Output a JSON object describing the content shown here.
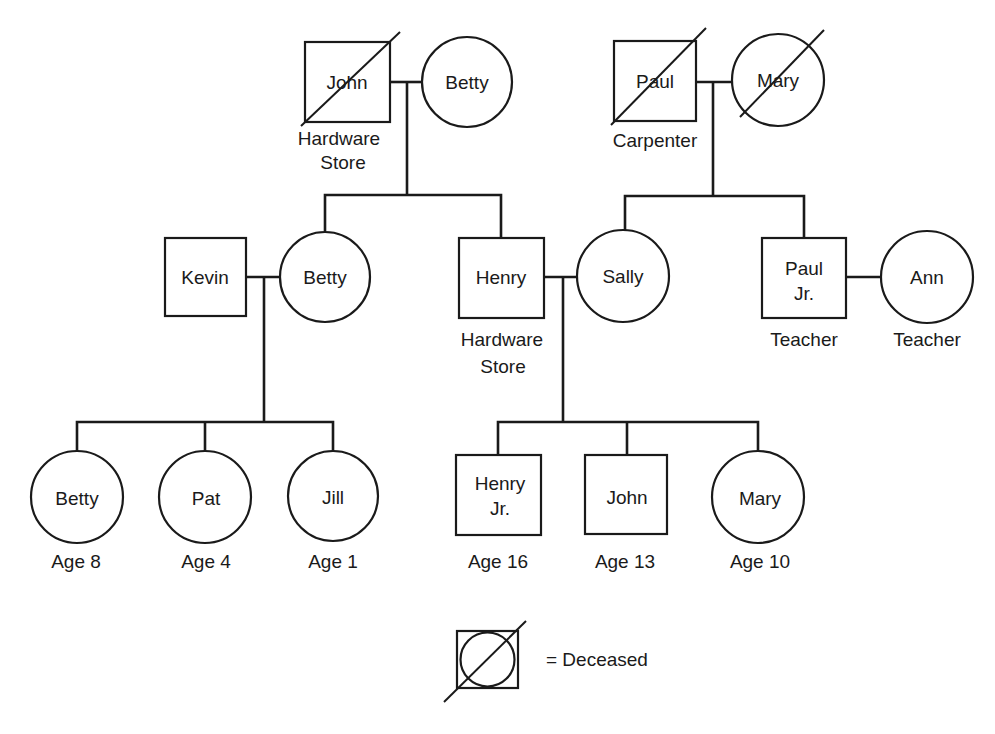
{
  "diagram": {
    "type": "genogram",
    "generation1": {
      "left_couple": {
        "husband": {
          "name": "John",
          "occupation_line1": "Hardware",
          "occupation_line2": "Store",
          "sex": "male",
          "deceased": true
        },
        "wife": {
          "name": "Betty",
          "sex": "female",
          "deceased": false
        }
      },
      "right_couple": {
        "husband": {
          "name": "Paul",
          "occupation": "Carpenter",
          "sex": "male",
          "deceased": true
        },
        "wife": {
          "name": "Mary",
          "sex": "female",
          "deceased": true
        }
      }
    },
    "generation2": {
      "kevin": {
        "name": "Kevin",
        "sex": "male"
      },
      "betty": {
        "name": "Betty",
        "sex": "female"
      },
      "henry": {
        "name": "Henry",
        "occupation_line1": "Hardware",
        "occupation_line2": "Store",
        "sex": "male"
      },
      "sally": {
        "name": "Sally",
        "sex": "female"
      },
      "paul_jr": {
        "name_line1": "Paul",
        "name_line2": "Jr.",
        "occupation": "Teacher",
        "sex": "male"
      },
      "ann": {
        "name": "Ann",
        "occupation": "Teacher",
        "sex": "female"
      }
    },
    "generation3": {
      "kevin_betty_children": [
        {
          "name": "Betty",
          "age": "Age 8",
          "sex": "female"
        },
        {
          "name": "Pat",
          "age": "Age 4",
          "sex": "female"
        },
        {
          "name": "Jill",
          "age": "Age 1",
          "sex": "female"
        }
      ],
      "henry_sally_children": [
        {
          "name_line1": "Henry",
          "name_line2": "Jr.",
          "age": "Age 16",
          "sex": "male"
        },
        {
          "name": "John",
          "age": "Age 13",
          "sex": "male"
        },
        {
          "name": "Mary",
          "age": "Age 10",
          "sex": "female"
        }
      ]
    },
    "legend": {
      "symbol": "deceased-symbol",
      "text": "= Deceased"
    }
  }
}
